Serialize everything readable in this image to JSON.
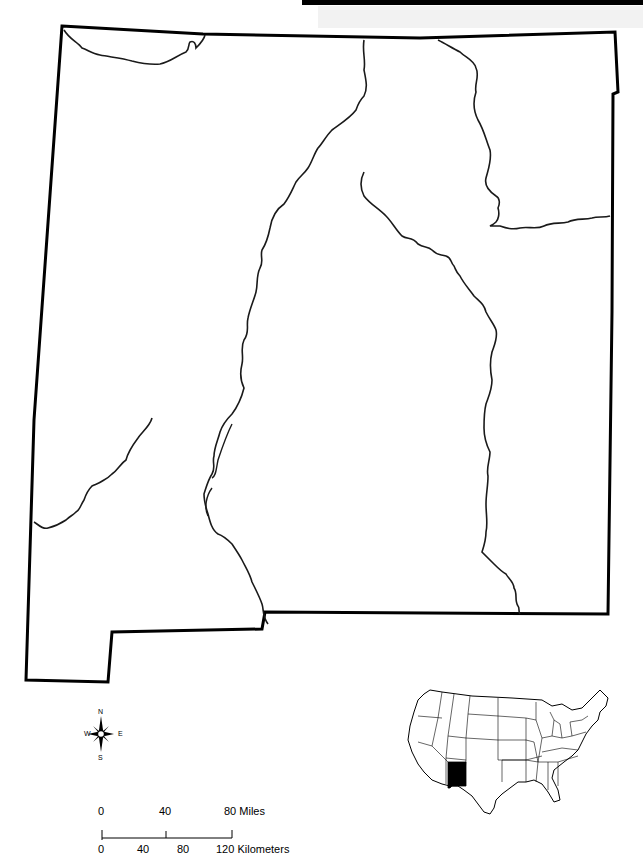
{
  "map": {
    "subject": "New Mexico",
    "features": [
      "state-border",
      "rivers"
    ],
    "colors": {
      "border": "#000000",
      "river": "#1a1a1a",
      "highlight": "#000000",
      "background": "#ffffff"
    }
  },
  "compass": {
    "n": "N",
    "s": "S",
    "e": "E",
    "w": "W"
  },
  "scale_bar": {
    "miles": {
      "ticks": [
        "0",
        "40",
        "80"
      ],
      "unit": "Miles"
    },
    "kilometers": {
      "ticks": [
        "0",
        "40",
        "80",
        "120"
      ],
      "unit": "Kilometers"
    }
  },
  "inset": {
    "region": "United States",
    "highlighted_state": "New Mexico"
  }
}
